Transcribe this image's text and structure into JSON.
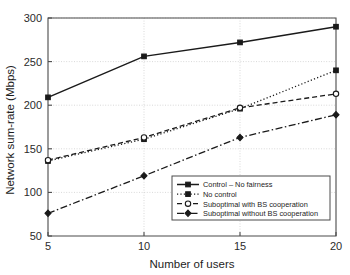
{
  "chart_data": {
    "type": "line",
    "title": "",
    "xlabel": "Number of users",
    "ylabel": "Network sum-rate (Mbps)",
    "x": [
      5,
      10,
      15,
      20
    ],
    "xticklabels": [
      "5",
      "10",
      "15",
      "20"
    ],
    "yticklabels": [
      "50",
      "100",
      "150",
      "200",
      "250",
      "300"
    ],
    "yticks": [
      50,
      100,
      150,
      200,
      250,
      300
    ],
    "xlim": [
      5,
      20
    ],
    "ylim": [
      50,
      300
    ],
    "grid": true,
    "legend_position": "lower right",
    "series": [
      {
        "name": "Control – No fairness",
        "values": [
          209,
          256,
          272,
          290
        ],
        "linestyle": "solid",
        "marker": "square-filled",
        "color": "#1a1a1a"
      },
      {
        "name": "No control",
        "values": [
          136,
          161,
          196,
          240
        ],
        "linestyle": "dotted",
        "marker": "square-filled",
        "color": "#1a1a1a"
      },
      {
        "name": "Suboptimal with BS cooperation",
        "values": [
          137,
          163,
          197,
          213
        ],
        "linestyle": "dashed",
        "marker": "circle-hollow",
        "color": "#1a1a1a"
      },
      {
        "name": "Suboptimal without BS cooperation",
        "values": [
          76,
          119,
          163,
          189
        ],
        "linestyle": "dashdot",
        "marker": "diamond-filled",
        "color": "#1a1a1a"
      }
    ]
  },
  "axes": {
    "x_title": "Number of users",
    "y_title": "Network sum-rate (Mbps)",
    "x_ticks": [
      "5",
      "10",
      "15",
      "20"
    ],
    "y_ticks": [
      "50",
      "100",
      "150",
      "200",
      "250",
      "300"
    ]
  },
  "legend": {
    "entries": [
      "Control – No fairness",
      "No control",
      "Suboptimal with BS cooperation",
      "Suboptimal without BS cooperation"
    ]
  },
  "colors": {
    "line": "#1a1a1a",
    "axis": "#4a4a4a",
    "grid": "#c9c9c9",
    "background": "#ffffff"
  }
}
